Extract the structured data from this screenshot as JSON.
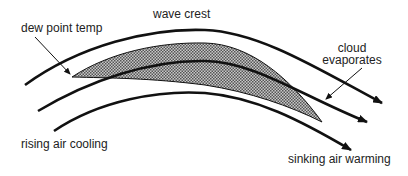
{
  "diagram": {
    "type": "wave cloud / lenticular cloud formation",
    "labels": {
      "dew_point": "dew point temp",
      "wave_crest": "wave crest",
      "cloud_evaporates_line1": "cloud",
      "cloud_evaporates_line2": "evaporates",
      "rising": "rising air cooling",
      "sinking": "sinking air warming"
    },
    "colors": {
      "line": "#111111",
      "cloud_fill": "#9a9a9a",
      "text": "#222222",
      "background": "#ffffff"
    },
    "airflow_lines": [
      {
        "name": "upper-airflow",
        "start": [
          25,
          85
        ],
        "end": [
          382,
          103
        ]
      },
      {
        "name": "middle-airflow",
        "start": [
          38,
          111
        ],
        "end": [
          367,
          122
        ]
      },
      {
        "name": "lower-airflow",
        "start": [
          54,
          131
        ],
        "end": [
          351,
          150
        ]
      }
    ]
  }
}
